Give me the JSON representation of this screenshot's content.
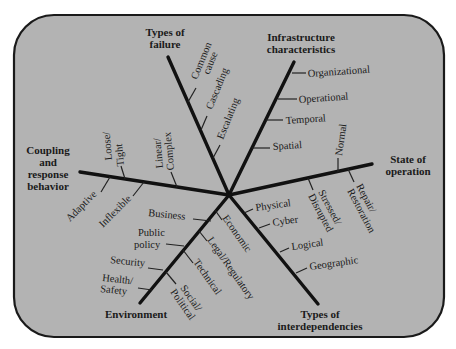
{
  "diagram": {
    "background_color": "#b3b3b3",
    "border_color": "#1a1a1a",
    "axes": [
      {
        "id": "types-of-failure",
        "title": [
          "Types of",
          "failure"
        ],
        "items": [
          "Common cause",
          "Cascading",
          "Escalating"
        ]
      },
      {
        "id": "infrastructure-characteristics",
        "title": [
          "Infrastructure",
          "characteristics"
        ],
        "items": [
          "Organizational",
          "Operational",
          "Temporal",
          "Spatial"
        ]
      },
      {
        "id": "state-of-operation",
        "title": [
          "State of",
          "operation"
        ],
        "items": [
          "Normal",
          "Repair/ Restoration",
          "Stressed/ Disrupted"
        ]
      },
      {
        "id": "types-of-interdependencies",
        "title": [
          "Types of",
          "interdependencies"
        ],
        "items": [
          "Physical",
          "Cyber",
          "Logical",
          "Geographic"
        ]
      },
      {
        "id": "environment",
        "title": [
          "Environment"
        ],
        "items": [
          "Economic",
          "Legal/Regulatory",
          "Technical",
          "Social/ Political",
          "Business",
          "Public policy",
          "Security",
          "Health/ Safety"
        ]
      },
      {
        "id": "coupling-and-response-behavior",
        "title": [
          "Coupling",
          "and",
          "response",
          "behavior"
        ],
        "items": [
          "Loose/ Tight",
          "Linear/ Complex",
          "Adaptive",
          "Inflexible"
        ]
      }
    ]
  },
  "labels": {
    "failure_t1": "Types of",
    "failure_t2": "failure",
    "common": "Common",
    "cause": "cause",
    "cascading": "Cascading",
    "escalating": "Escalating",
    "infra_t1": "Infrastructure",
    "infra_t2": "characteristics",
    "organizational": "Organizational",
    "operational": "Operational",
    "temporal": "Temporal",
    "spatial": "Spatial",
    "state_t1": "State of",
    "state_t2": "operation",
    "normal": "Normal",
    "repair": "Repair/",
    "restoration": "Restoration",
    "stressed": "Stressed/",
    "disrupted": "Disrupted",
    "interdep_t1": "Types of",
    "interdep_t2": "interdependencies",
    "physical": "Physical",
    "cyber": "Cyber",
    "logical": "Logical",
    "geographic": "Geographic",
    "env_t1": "Environment",
    "economic": "Economic",
    "legal": "Legal/Regulatory",
    "technical": "Technical",
    "social": "Social/",
    "political": "Political",
    "business": "Business",
    "public": "Public",
    "policy": "policy",
    "security": "Security",
    "health": "Health/",
    "safety": "Safety",
    "coupling_t1": "Coupling",
    "coupling_t2": "and",
    "coupling_t3": "response",
    "coupling_t4": "behavior",
    "loose": "Loose/",
    "tight": "Tight",
    "linear": "Linear/",
    "complex": "Complex",
    "adaptive": "Adaptive",
    "inflexible": "Inflexible"
  }
}
